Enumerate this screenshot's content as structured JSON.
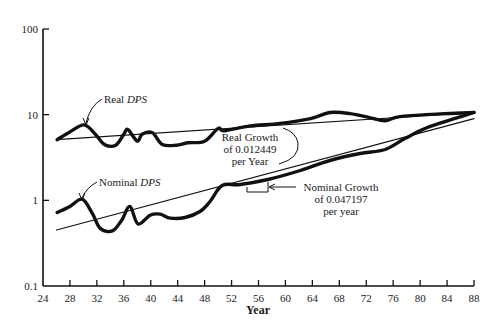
{
  "chart_data": {
    "type": "line",
    "title": "",
    "xlabel": "Year",
    "ylabel": "",
    "yscale": "log",
    "xlim": [
      24,
      88
    ],
    "ylim": [
      0.1,
      100
    ],
    "grid": false,
    "legend": null,
    "x_ticks": [
      "24",
      "28",
      "32",
      "36",
      "40",
      "44",
      "48",
      "52",
      "56",
      "60",
      "64",
      "68",
      "72",
      "76",
      "80",
      "84",
      "88"
    ],
    "y_ticks": [
      "0.1",
      "1",
      "10",
      "100"
    ],
    "series": [
      {
        "name": "Real DPS",
        "label_text": "Real",
        "label_italic": "DPS",
        "x": [
          26.1,
          28,
          30.1,
          31.7,
          33.1,
          34.8,
          36,
          36.6,
          38,
          38.7,
          40.2,
          41.7,
          43.8,
          45.5,
          48,
          50,
          50.9,
          54.8,
          59.2,
          63.7,
          66.6,
          69.6,
          72.6,
          74.8,
          77,
          83,
          88
        ],
        "values": [
          5.1,
          6.3,
          7.6,
          6.0,
          4.5,
          4.4,
          5.9,
          6.7,
          4.9,
          5.9,
          6.2,
          4.5,
          4.4,
          4.7,
          4.9,
          6.9,
          6.5,
          7.4,
          7.9,
          9.0,
          10.6,
          10.3,
          9.2,
          8.5,
          9.5,
          10.2,
          10.6
        ]
      },
      {
        "name": "Nominal DPS",
        "label_text": "Nominal",
        "label_italic": "DPS",
        "x": [
          26.1,
          28,
          29.8,
          31.3,
          32.5,
          34.3,
          35.7,
          36.9,
          38.1,
          39.9,
          41.4,
          42.9,
          45.1,
          47.3,
          48.8,
          50.6,
          53.3,
          57.4,
          62.2,
          66.6,
          71.1,
          74.8,
          77.8,
          81.5,
          88
        ],
        "values": [
          0.72,
          0.85,
          1.03,
          0.71,
          0.47,
          0.44,
          0.59,
          0.85,
          0.53,
          0.67,
          0.69,
          0.62,
          0.63,
          0.74,
          0.97,
          1.49,
          1.53,
          1.75,
          2.23,
          2.92,
          3.52,
          3.92,
          5.3,
          7.3,
          10.6
        ]
      },
      {
        "name": "Real trend",
        "x": [
          26,
          88
        ],
        "values": [
          5.1,
          10.6
        ]
      },
      {
        "name": "Nominal trend",
        "x": [
          26,
          88
        ],
        "values": [
          0.45,
          9.0
        ]
      }
    ],
    "annotations": [
      {
        "lines": [
          "Real Growth",
          "of 0.012449",
          "per Year"
        ]
      },
      {
        "lines": [
          "Nominal Growth",
          "of 0.047197",
          "per year"
        ]
      }
    ]
  }
}
